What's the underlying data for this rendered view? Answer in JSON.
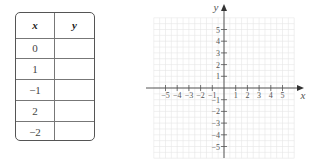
{
  "table": {
    "headers": [
      "x",
      "y"
    ],
    "rows": [
      {
        "x": "0",
        "y": ""
      },
      {
        "x": "1",
        "y": ""
      },
      {
        "x": "−1",
        "y": ""
      },
      {
        "x": "2",
        "y": ""
      },
      {
        "x": "−2",
        "y": ""
      }
    ]
  },
  "graph": {
    "x_axis_label": "x",
    "y_axis_label": "y",
    "x_ticks": [
      -5,
      -4,
      -3,
      -2,
      -1,
      1,
      2,
      3,
      4,
      5
    ],
    "y_ticks": [
      5,
      4,
      3,
      2,
      1,
      -1,
      -2,
      -3,
      -4,
      -5
    ],
    "x_tick_labels": [
      "−5",
      "−4",
      "−3",
      "−2",
      "−1",
      "1",
      "2",
      "3",
      "4",
      "5"
    ],
    "y_tick_labels": [
      "5",
      "4",
      "3",
      "2",
      "1",
      "−1",
      "−2",
      "−3",
      "−4",
      "−5"
    ],
    "range": {
      "min": -6,
      "max": 6
    },
    "grid": true,
    "colors": {
      "grid": "#e6e6e6",
      "axis": "#555555",
      "text": "#555555"
    }
  }
}
